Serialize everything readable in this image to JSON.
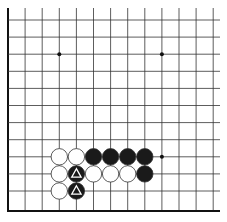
{
  "diagram": {
    "type": "go-board-fragment",
    "colors": {
      "background": "#ffffff",
      "line": "#333333",
      "border": "#111111",
      "black_stone": "#1a1a1a",
      "white_stone": "#ffffff",
      "stone_outline": "#333333",
      "marker": "#ffffff"
    },
    "grid": {
      "columns": 13,
      "rows": 12,
      "origin_x": 8,
      "origin_y": 20,
      "spacing": 17.1,
      "extend_right": 220,
      "extend_top": 8,
      "bottom_y": 211,
      "left_border": true,
      "bottom_border": true
    },
    "star_points": [
      {
        "col": 3,
        "row": 2
      },
      {
        "col": 9,
        "row": 2
      },
      {
        "col": 9,
        "row": 8
      }
    ],
    "stones": [
      {
        "col": 3,
        "row": 8,
        "color": "white"
      },
      {
        "col": 4,
        "row": 8,
        "color": "white"
      },
      {
        "col": 5,
        "row": 8,
        "color": "black"
      },
      {
        "col": 6,
        "row": 8,
        "color": "black"
      },
      {
        "col": 7,
        "row": 8,
        "color": "black"
      },
      {
        "col": 8,
        "row": 8,
        "color": "black"
      },
      {
        "col": 3,
        "row": 9,
        "color": "white"
      },
      {
        "col": 4,
        "row": 9,
        "color": "black",
        "marker": "triangle"
      },
      {
        "col": 5,
        "row": 9,
        "color": "white"
      },
      {
        "col": 6,
        "row": 9,
        "color": "white"
      },
      {
        "col": 7,
        "row": 9,
        "color": "white"
      },
      {
        "col": 8,
        "row": 9,
        "color": "black"
      },
      {
        "col": 3,
        "row": 10,
        "color": "white"
      },
      {
        "col": 4,
        "row": 10,
        "color": "black",
        "marker": "triangle"
      }
    ]
  }
}
